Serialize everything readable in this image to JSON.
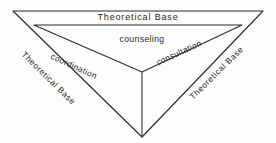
{
  "diagram": {
    "background_color": "#fdfdfd",
    "line_color": "#2b2b2b",
    "text_color": "#262626",
    "labels": {
      "top_base": "Theoretical Base",
      "left_base": "Theoretical Base",
      "right_base": "Theoretical Base",
      "center_top": "counseling",
      "left_inner": "coordination",
      "right_inner": "consultation"
    },
    "geometry": {
      "outer_triangle": {
        "top_left": [
          13,
          11
        ],
        "top_right": [
          263,
          11
        ],
        "bottom": [
          142,
          137
        ]
      },
      "inner_triangle": {
        "top_left": [
          34,
          25
        ],
        "top_right": [
          242,
          25
        ],
        "bottom": [
          142,
          72
        ]
      },
      "center_line": {
        "from": [
          142,
          72
        ],
        "to": [
          142,
          137
        ]
      }
    }
  }
}
